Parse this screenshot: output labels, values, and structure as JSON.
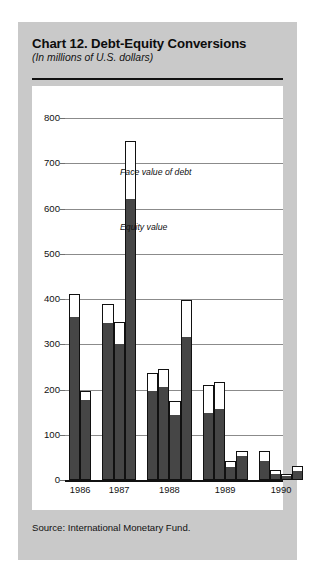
{
  "chart": {
    "title": "Chart 12. Debt-Equity Conversions",
    "subtitle": "(In millions of U.S. dollars)",
    "source": "Source:  International Monetary Fund.",
    "annotations": {
      "face": "Face value of debt",
      "equity": "Equity value"
    }
  },
  "chart_data": {
    "type": "bar",
    "title": "Chart 12. Debt-Equity Conversions",
    "subtitle": "(In millions of U.S. dollars)",
    "xlabel": "",
    "ylabel": "In millions of U.S. dollars",
    "ylim": [
      0,
      800
    ],
    "yticks": [
      0,
      100,
      200,
      300,
      400,
      500,
      600,
      700,
      800
    ],
    "grid": true,
    "legend_position": "inline-annotations",
    "series": [
      {
        "name": "Face value of debt",
        "color": "#ffffff"
      },
      {
        "name": "Equity value",
        "color": "#464646"
      }
    ],
    "categories": [
      "1986",
      "1987",
      "1988",
      "1989",
      "1990"
    ],
    "groups": [
      {
        "year": "1986",
        "bars": [
          {
            "face_value": 410,
            "equity_value": 362
          },
          {
            "face_value": 197,
            "equity_value": 178
          }
        ]
      },
      {
        "year": "1987",
        "bars": [
          {
            "face_value": 388,
            "equity_value": 348
          },
          {
            "face_value": 350,
            "equity_value": 303
          },
          {
            "face_value": 750,
            "equity_value": 622
          }
        ]
      },
      {
        "year": "1988",
        "bars": [
          {
            "face_value": 237,
            "equity_value": 199
          },
          {
            "face_value": 246,
            "equity_value": 208
          },
          {
            "face_value": 174,
            "equity_value": 145
          },
          {
            "face_value": 398,
            "equity_value": 318
          }
        ]
      },
      {
        "year": "1989",
        "bars": [
          {
            "face_value": 210,
            "equity_value": 150
          },
          {
            "face_value": 217,
            "equity_value": 157
          },
          {
            "face_value": 42,
            "equity_value": 30
          },
          {
            "face_value": 65,
            "equity_value": 55
          }
        ]
      },
      {
        "year": "1990",
        "bars": [
          {
            "face_value": 63,
            "equity_value": 42
          },
          {
            "face_value": 22,
            "equity_value": 15
          },
          {
            "face_value": 14,
            "equity_value": 10
          },
          {
            "face_value": 30,
            "equity_value": 22
          }
        ]
      }
    ]
  }
}
